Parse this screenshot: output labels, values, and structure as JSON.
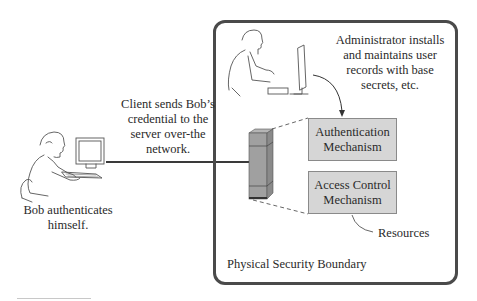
{
  "diagram": {
    "boundary": {
      "label": "Physical Security Boundary",
      "border_color": "#4a4a4a"
    },
    "client": {
      "caption_lines": [
        "Bob authenticates",
        "himself."
      ]
    },
    "network": {
      "caption_lines": [
        "Client sends Bob’s",
        "credential to the",
        "server over-the",
        "network."
      ]
    },
    "administrator": {
      "caption_lines": [
        "Administrator installs",
        "and maintains user",
        "records with base",
        "secrets, etc."
      ]
    },
    "mechanisms": [
      {
        "lines": [
          "Authentication",
          "Mechanism"
        ],
        "fill": "#d6d6d6"
      },
      {
        "lines": [
          "Access Control",
          "Mechanism"
        ],
        "fill": "#d6d6d6"
      }
    ],
    "resources": {
      "label": "Resources"
    }
  }
}
